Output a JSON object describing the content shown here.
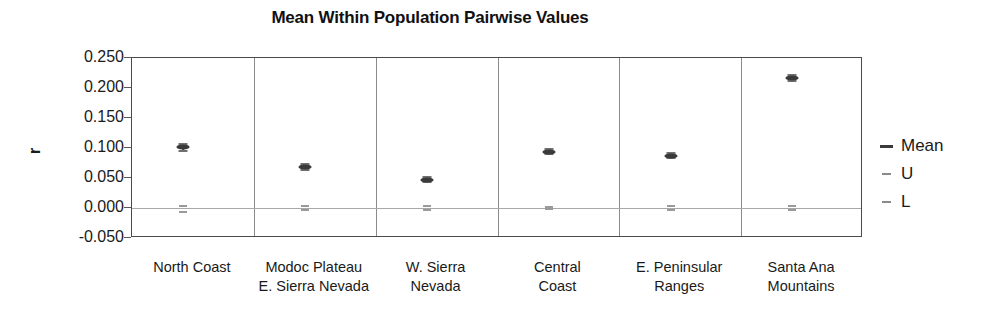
{
  "chart_data": {
    "type": "scatter",
    "title": "Mean Within Population Pairwise Values",
    "xlabel": "",
    "ylabel": "r",
    "ylim": [
      -0.05,
      0.25
    ],
    "yticks": [
      "0.250",
      "0.200",
      "0.150",
      "0.100",
      "0.050",
      "0.000",
      "-0.050"
    ],
    "ytick_values": [
      0.25,
      0.2,
      0.15,
      0.1,
      0.05,
      0.0,
      -0.05
    ],
    "grid": false,
    "legend_position": "right",
    "categories": [
      "North Coast",
      "Modoc Plateau E. Sierra Nevada",
      "W. Sierra Nevada",
      "Central Coast",
      "E. Peninsular Ranges",
      "Santa Ana Mountains"
    ],
    "category_lines": [
      [
        "North Coast",
        ""
      ],
      [
        "Modoc Plateau",
        "E. Sierra Nevada"
      ],
      [
        "W. Sierra",
        "Nevada"
      ],
      [
        "Central",
        "Coast"
      ],
      [
        "E. Peninsular",
        "Ranges"
      ],
      [
        "Santa Ana",
        "Mountains"
      ]
    ],
    "series": [
      {
        "name": "Mean",
        "values": [
          0.101,
          0.068,
          0.047,
          0.094,
          0.087,
          0.216
        ]
      },
      {
        "name": "U",
        "values": [
          0.107,
          0.073,
          0.051,
          0.098,
          0.092,
          0.221
        ]
      },
      {
        "name": "L",
        "values": [
          0.095,
          0.064,
          0.043,
          0.09,
          0.083,
          0.211
        ]
      }
    ],
    "null_band": {
      "description": "Near-zero upper and lower confidence ticks drawn at the 0.000 line in each panel",
      "upper": [
        0.004,
        0.004,
        0.004,
        0.002,
        0.004,
        0.003
      ],
      "lower": [
        -0.006,
        -0.004,
        -0.004,
        -0.002,
        -0.004,
        -0.003
      ]
    },
    "legend": [
      {
        "label": "Mean",
        "marker": "dash-dark"
      },
      {
        "label": "U",
        "marker": "dash-light"
      },
      {
        "label": "L",
        "marker": "dash-light"
      }
    ],
    "colors": {
      "mean": "#3a3a3a",
      "bounds": "#707070",
      "axis": "#4a4a4a",
      "panel_separator": "#8a8a8a",
      "zero_line": "#a8a8a8",
      "text": "#1a1a1a",
      "background": "#ffffff"
    }
  }
}
